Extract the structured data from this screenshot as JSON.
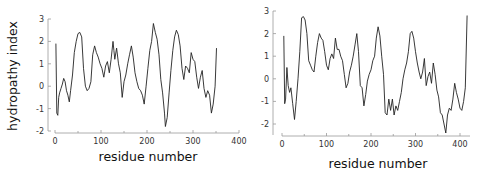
{
  "chart_data": [
    {
      "type": "line",
      "title": "",
      "xlabel": "residue number",
      "ylabel": "hydropathy index",
      "xlim": [
        0,
        400
      ],
      "ylim": [
        -2,
        3
      ],
      "xticks": [
        0,
        100,
        200,
        300,
        400
      ],
      "yticks": [
        -2,
        -1,
        0,
        1,
        2,
        3
      ],
      "grid": false,
      "legend": null,
      "series": [
        {
          "name": "hydropathy profile (left)",
          "x": [
            2,
            4,
            6,
            8,
            10,
            13,
            16,
            19,
            22,
            25,
            28,
            31,
            34,
            38,
            42,
            46,
            50,
            54,
            58,
            62,
            66,
            70,
            74,
            78,
            82,
            86,
            90,
            94,
            98,
            102,
            106,
            110,
            114,
            118,
            122,
            126,
            128,
            130,
            134,
            138,
            142,
            146,
            150,
            154,
            158,
            162,
            166,
            170,
            174,
            178,
            182,
            186,
            190,
            194,
            198,
            202,
            206,
            210,
            214,
            218,
            222,
            226,
            230,
            234,
            238,
            240,
            244,
            248,
            252,
            256,
            260,
            264,
            268,
            272,
            276,
            280,
            284,
            288,
            292,
            296,
            300,
            304,
            308,
            312,
            316,
            320,
            324,
            328,
            332,
            336,
            340,
            344,
            348,
            351
          ],
          "y": [
            1.9,
            -1.2,
            -1.3,
            -0.5,
            -0.3,
            -0.1,
            0.1,
            0.35,
            0.2,
            -0.2,
            -0.4,
            -0.7,
            -0.2,
            0.5,
            1.5,
            2.0,
            2.35,
            2.4,
            2.2,
            0.8,
            0.0,
            -0.2,
            -0.1,
            0.2,
            1.4,
            1.8,
            1.5,
            1.3,
            1.0,
            0.8,
            0.4,
            0.9,
            1.1,
            0.6,
            1.2,
            2.0,
            1.6,
            1.2,
            1.7,
            1.0,
            0.6,
            -0.5,
            0.2,
            0.5,
            1.0,
            1.4,
            1.8,
            1.3,
            0.6,
            0.2,
            -0.1,
            -0.2,
            -0.4,
            -0.8,
            0.0,
            0.8,
            1.6,
            2.0,
            2.8,
            2.4,
            2.1,
            1.4,
            0.3,
            -0.3,
            -1.2,
            -1.8,
            -1.4,
            -0.3,
            0.7,
            1.6,
            2.2,
            2.5,
            2.3,
            1.8,
            0.8,
            0.3,
            0.9,
            0.8,
            0.6,
            1.5,
            1.2,
            1.1,
            0.4,
            -0.1,
            0.4,
            0.7,
            -0.1,
            -0.5,
            -0.2,
            -0.4,
            -1.2,
            -0.8,
            0.0,
            1.7
          ]
        }
      ]
    },
    {
      "type": "line",
      "title": "",
      "xlabel": "residue number",
      "ylabel": "",
      "xlim": [
        0,
        420
      ],
      "ylim": [
        -2.5,
        3
      ],
      "xticks": [
        0,
        100,
        200,
        300,
        400
      ],
      "yticks": [
        -2,
        -1,
        0,
        1,
        2,
        3
      ],
      "grid": false,
      "legend": null,
      "series": [
        {
          "name": "hydropathy profile (right)",
          "x": [
            4,
            6,
            8,
            11,
            14,
            17,
            20,
            24,
            28,
            32,
            36,
            40,
            44,
            48,
            52,
            56,
            60,
            64,
            68,
            72,
            76,
            80,
            84,
            88,
            92,
            96,
            100,
            104,
            108,
            112,
            116,
            120,
            124,
            128,
            132,
            136,
            140,
            144,
            148,
            152,
            156,
            160,
            164,
            168,
            172,
            176,
            180,
            184,
            188,
            192,
            196,
            200,
            204,
            208,
            212,
            216,
            220,
            224,
            228,
            232,
            236,
            240,
            244,
            248,
            252,
            256,
            260,
            264,
            268,
            272,
            276,
            280,
            284,
            288,
            292,
            296,
            300,
            304,
            308,
            312,
            316,
            320,
            324,
            328,
            332,
            336,
            340,
            344,
            348,
            352,
            356,
            360,
            364,
            368,
            372,
            376,
            380,
            384,
            388,
            392,
            396,
            400,
            404,
            408,
            412,
            416
          ],
          "y": [
            1.9,
            -1.1,
            -0.9,
            0.5,
            -0.3,
            -0.6,
            -0.4,
            -1.1,
            -1.8,
            -1.0,
            0.0,
            1.2,
            2.7,
            2.75,
            2.6,
            2.0,
            0.8,
            0.6,
            0.4,
            0.3,
            1.0,
            1.6,
            2.0,
            1.8,
            1.7,
            1.2,
            0.6,
            0.4,
            0.9,
            1.1,
            0.9,
            1.8,
            1.3,
            1.3,
            1.0,
            0.8,
            0.2,
            -0.4,
            -0.2,
            0.3,
            0.6,
            1.0,
            1.5,
            2.0,
            1.2,
            -0.3,
            -0.4,
            -1.2,
            -0.7,
            -0.1,
            0.2,
            0.4,
            0.8,
            1.0,
            1.8,
            2.3,
            1.9,
            1.0,
            0.2,
            -1.5,
            -1.6,
            -0.9,
            -1.4,
            -0.9,
            -1.6,
            -1.2,
            -1.4,
            -1.0,
            -0.6,
            0.0,
            0.4,
            0.7,
            1.2,
            2.0,
            2.1,
            1.8,
            1.2,
            0.7,
            0.3,
            0.0,
            0.3,
            0.9,
            -0.3,
            0.1,
            0.3,
            -0.2,
            0.7,
            0.2,
            -0.5,
            -0.8,
            -1.5,
            -1.6,
            -2.0,
            -2.4,
            -1.6,
            -1.3,
            -1.4,
            -0.9,
            -0.2,
            -0.6,
            -0.9,
            -1.3,
            -1.4,
            -1.0,
            -0.4,
            2.8
          ]
        }
      ]
    }
  ],
  "labels": {
    "left_ylabel": "hydropathy index",
    "left_xlabel": "residue number",
    "right_xlabel": "residue number",
    "left_yticks": [
      "3",
      "2",
      "1",
      "0",
      "-1",
      "-2"
    ],
    "left_xticks": [
      "0",
      "100",
      "200",
      "300",
      "400"
    ],
    "right_yticks": [
      "3",
      "2",
      "1",
      "0",
      "-1",
      "-2"
    ],
    "right_xticks": [
      "0",
      "100",
      "200",
      "300",
      "400"
    ]
  }
}
